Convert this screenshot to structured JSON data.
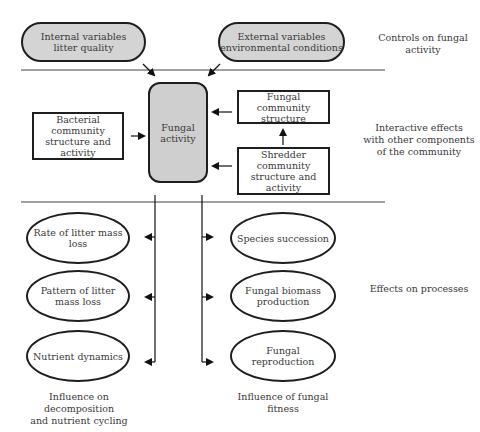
{
  "controls": {
    "internal": {
      "line1": "Internal variables",
      "line2": "litter quality"
    },
    "external": {
      "line1": "External variables",
      "line2": "environmental conditions"
    },
    "label": {
      "line1": "Controls on fungal",
      "line2": "activity"
    }
  },
  "core": {
    "line1": "Fungal",
    "line2": "activity"
  },
  "interactions": {
    "bacterial": {
      "line1": "Bacterial community",
      "line2": "structure and activity"
    },
    "fungal_community": {
      "line1": "Fungal community",
      "line2": "structure"
    },
    "shredder": {
      "line1": "Shredder community",
      "line2": "structure and activity"
    },
    "label": {
      "line1": "Interactive effects",
      "line2": "with other components",
      "line3": "of the community"
    }
  },
  "processes": {
    "left": [
      {
        "line1": "Rate of litter mass",
        "line2": "loss"
      },
      {
        "line1": "Pattern of litter",
        "line2": "mass loss"
      },
      {
        "line1": "Nutrient dynamics",
        "line2": ""
      }
    ],
    "right": [
      {
        "line1": "Species succession",
        "line2": ""
      },
      {
        "line1": "Fungal biomass",
        "line2": "production"
      },
      {
        "line1": "Fungal",
        "line2": "reproduction"
      }
    ],
    "label": "Effects on processes"
  },
  "footers": {
    "left": {
      "line1": "Influence on decomposition",
      "line2": "and nutrient cycling"
    },
    "right": {
      "line1": "Influence of fungal",
      "line2": "fitness"
    }
  }
}
